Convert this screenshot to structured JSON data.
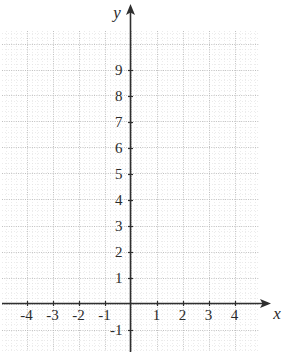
{
  "chart_data": {
    "type": "scatter",
    "title": "",
    "xlabel": "x",
    "ylabel": "y",
    "series": [],
    "x": [],
    "values": [],
    "xlim": [
      -4.9,
      4.95
    ],
    "ylim": [
      -1.9,
      9.4
    ],
    "grid": true,
    "grid_major_step": 1,
    "grid_minor_subdivisions": 5,
    "legend": "none",
    "x_tick_labels": [
      "-4",
      "-3",
      "-2",
      "-1",
      "1",
      "2",
      "3",
      "4"
    ],
    "x_tick_values": [
      -4,
      -3,
      -2,
      -1,
      1,
      2,
      3,
      4
    ],
    "y_tick_labels": [
      "9",
      "8",
      "7",
      "6",
      "5",
      "4",
      "3",
      "2",
      "1",
      "-1"
    ],
    "y_tick_values": [
      9,
      8,
      7,
      6,
      5,
      4,
      3,
      2,
      1,
      -1
    ],
    "axis_arrows": [
      "x-positive",
      "y-positive"
    ],
    "colors": {
      "axis": "#2f2f2f",
      "grid_major": "#b9b9b9",
      "grid_minor": "#dcdcdc",
      "label": "#2b2b2b",
      "background": "#ffffff"
    }
  },
  "axes": {
    "x_axis_label": "x",
    "y_axis_label": "y"
  },
  "ticks": {
    "x": [
      {
        "label": "-4",
        "value": -4
      },
      {
        "label": "-3",
        "value": -3
      },
      {
        "label": "-2",
        "value": -2
      },
      {
        "label": "-1",
        "value": -1
      },
      {
        "label": "1",
        "value": 1
      },
      {
        "label": "2",
        "value": 2
      },
      {
        "label": "3",
        "value": 3
      },
      {
        "label": "4",
        "value": 4
      }
    ],
    "y": [
      {
        "label": "9",
        "value": 9
      },
      {
        "label": "8",
        "value": 8
      },
      {
        "label": "7",
        "value": 7
      },
      {
        "label": "6",
        "value": 6
      },
      {
        "label": "5",
        "value": 5
      },
      {
        "label": "4",
        "value": 4
      },
      {
        "label": "3",
        "value": 3
      },
      {
        "label": "2",
        "value": 2
      },
      {
        "label": "1",
        "value": 1
      },
      {
        "label": "-1",
        "value": -1
      }
    ]
  }
}
